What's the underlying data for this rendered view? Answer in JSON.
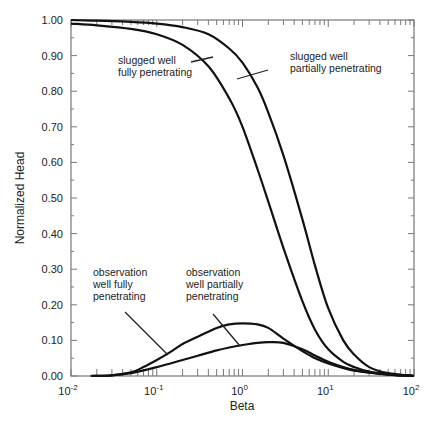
{
  "chart_data": {
    "type": "line",
    "title": "",
    "xlabel": "Beta",
    "ylabel": "Normalized Head",
    "xscale": "log",
    "xlim": [
      0.01,
      100
    ],
    "ylim": [
      0.0,
      1.0
    ],
    "grid": false,
    "legend": "none (inline annotations)",
    "x_tick_labels": [
      {
        "base": "10",
        "exp": "-2",
        "value": 0.01
      },
      {
        "base": "10",
        "exp": "-1",
        "value": 0.1
      },
      {
        "base": "10",
        "exp": "0",
        "value": 1
      },
      {
        "base": "10",
        "exp": "1",
        "value": 10
      },
      {
        "base": "10",
        "exp": "2",
        "value": 100
      }
    ],
    "y_tick_labels": [
      "0.00",
      "0.10",
      "0.20",
      "0.30",
      "0.40",
      "0.50",
      "0.60",
      "0.70",
      "0.80",
      "0.90",
      "1.00"
    ],
    "series": [
      {
        "name": "slugged well fully penetrating",
        "x": [
          0.01,
          0.02,
          0.05,
          0.1,
          0.2,
          0.4,
          0.7,
          1.0,
          1.5,
          2.0,
          3.0,
          5.0,
          7.0,
          10,
          15,
          20,
          30,
          50,
          100
        ],
        "y": [
          0.99,
          0.985,
          0.975,
          0.96,
          0.93,
          0.87,
          0.78,
          0.7,
          0.58,
          0.49,
          0.36,
          0.21,
          0.13,
          0.075,
          0.04,
          0.025,
          0.012,
          0.005,
          0.0
        ]
      },
      {
        "name": "slugged well partially penetrating",
        "x": [
          0.01,
          0.02,
          0.05,
          0.1,
          0.2,
          0.4,
          0.7,
          1.0,
          1.5,
          2.0,
          3.0,
          5.0,
          7.0,
          10,
          15,
          20,
          30,
          50,
          100
        ],
        "y": [
          1.0,
          0.998,
          0.995,
          0.99,
          0.98,
          0.96,
          0.92,
          0.88,
          0.81,
          0.74,
          0.62,
          0.44,
          0.31,
          0.19,
          0.1,
          0.06,
          0.025,
          0.008,
          0.0
        ]
      },
      {
        "name": "observation well fully penetrating",
        "x": [
          0.017,
          0.03,
          0.05,
          0.07,
          0.1,
          0.15,
          0.2,
          0.3,
          0.5,
          0.7,
          1.0,
          1.5,
          2.0,
          3.0,
          5.0,
          7.0,
          10,
          20,
          50,
          100
        ],
        "y": [
          0.0,
          0.002,
          0.01,
          0.025,
          0.045,
          0.07,
          0.09,
          0.11,
          0.135,
          0.145,
          0.148,
          0.145,
          0.135,
          0.105,
          0.07,
          0.05,
          0.035,
          0.015,
          0.004,
          0.0
        ]
      },
      {
        "name": "observation well partially penetrating",
        "x": [
          0.017,
          0.03,
          0.05,
          0.1,
          0.2,
          0.3,
          0.5,
          0.7,
          1.0,
          1.5,
          2.0,
          3.0,
          5.0,
          7.0,
          10,
          20,
          50,
          100
        ],
        "y": [
          0.0,
          0.002,
          0.008,
          0.025,
          0.045,
          0.057,
          0.072,
          0.08,
          0.087,
          0.093,
          0.095,
          0.093,
          0.075,
          0.058,
          0.04,
          0.017,
          0.004,
          0.0
        ]
      }
    ],
    "annotations": [
      {
        "lines": [
          "slugged well",
          "fully penetrating"
        ],
        "target": "slugged well fully penetrating"
      },
      {
        "lines": [
          "slugged well",
          "partially penetrating"
        ],
        "target": "slugged well partially penetrating"
      },
      {
        "lines": [
          "observation",
          "well fully",
          "penetrating"
        ],
        "target": "observation well fully penetrating"
      },
      {
        "lines": [
          "observation",
          "well partially",
          "penetrating"
        ],
        "target": "observation well partially penetrating"
      }
    ]
  }
}
